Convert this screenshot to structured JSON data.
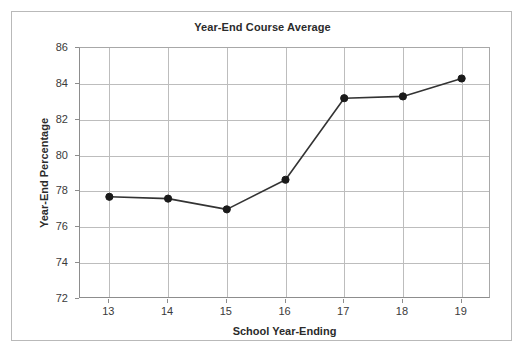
{
  "chart_data": {
    "type": "line",
    "title": "Year-End Course Average",
    "xlabel": "School Year-Ending",
    "ylabel": "Year-End Percentage",
    "categories": [
      "13",
      "14",
      "15",
      "16",
      "17",
      "18",
      "19"
    ],
    "x": [
      13,
      14,
      15,
      16,
      17,
      18,
      19
    ],
    "values": [
      77.7,
      77.6,
      77.0,
      78.65,
      83.2,
      83.3,
      84.3
    ],
    "series": [
      {
        "name": "Year-End Percentage",
        "values": [
          77.7,
          77.6,
          77.0,
          78.65,
          83.2,
          83.3,
          84.3
        ]
      }
    ],
    "ylim": [
      72,
      86
    ],
    "xlim": [
      12.5,
      19.5
    ],
    "yticks": [
      72,
      74,
      76,
      78,
      80,
      82,
      84,
      86
    ],
    "ytick_labels": [
      "72",
      "74",
      "76",
      "78",
      "80",
      "82",
      "84",
      "86"
    ],
    "xticks": [
      13,
      14,
      15,
      16,
      17,
      18,
      19
    ],
    "xtick_labels": [
      "13",
      "14",
      "15",
      "16",
      "17",
      "18",
      "19"
    ],
    "grid": "both",
    "legend": "none",
    "marker": "filled-circle",
    "line_color": "#333333",
    "marker_color": "#1a1a1a",
    "grid_color": "#bdbdbd",
    "axis_color": "#8d8d8d",
    "background_color": "#ffffff",
    "border_color": "#b9b9b9"
  }
}
